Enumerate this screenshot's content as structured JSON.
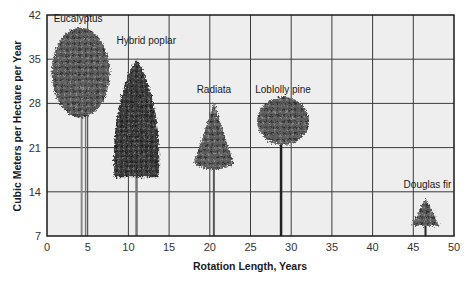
{
  "chart_data": {
    "type": "scatter",
    "title": "",
    "xlabel": "Rotation Length, Years",
    "ylabel": "Cubic Meters per Hectare per Year",
    "xlim": [
      0,
      50
    ],
    "ylim": [
      7,
      42
    ],
    "x_ticks": [
      0,
      5,
      10,
      15,
      20,
      25,
      30,
      35,
      40,
      45,
      50
    ],
    "y_ticks": [
      7,
      14,
      21,
      28,
      35,
      42
    ],
    "grid": true,
    "marker": "tree illustration",
    "points": [
      {
        "name": "Eucalyptus",
        "x": 4.5,
        "y": 40,
        "shape": "broad-oval"
      },
      {
        "name": "Hybrid poplar",
        "x": 11,
        "y": 35,
        "shape": "columnar"
      },
      {
        "name": "Radiata",
        "x": 20.5,
        "y": 28,
        "shape": "conical-open"
      },
      {
        "name": "Loblolly pine",
        "x": 29,
        "y": 29,
        "shape": "round-crown"
      },
      {
        "name": "Douglas fir",
        "x": 46.5,
        "y": 13,
        "shape": "conical"
      }
    ]
  },
  "colors": {
    "plot_bg": "#eeeeee",
    "grid": "#3a3a3a",
    "frame": "#1a1a1a",
    "foliage_dark": "#2e2e2e",
    "foliage_mid": "#6a6a6a",
    "foliage_light": "#9a9a9a",
    "trunk": "#555555"
  }
}
